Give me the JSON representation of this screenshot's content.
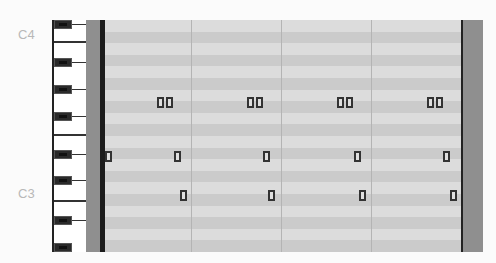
{
  "app": {
    "view": "piano-roll"
  },
  "octave_labels": [
    {
      "label": "C4",
      "y": 33
    },
    {
      "label": "C3",
      "y": 192
    }
  ],
  "colors": {
    "grid_light": "#dcdcdc",
    "grid_dark": "#cbcbcb",
    "side_strip": "#8f8f8f",
    "bar_line": "#1c1c1c",
    "note_border": "#333333"
  },
  "grid": {
    "beat_lines_x": [
      86,
      176,
      266
    ],
    "rows": 20
  },
  "notes": [
    {
      "x": 52,
      "y": 77,
      "group": 1
    },
    {
      "x": 61,
      "y": 77,
      "group": 1
    },
    {
      "x": 142,
      "y": 77,
      "group": 2
    },
    {
      "x": 151,
      "y": 77,
      "group": 2
    },
    {
      "x": 232,
      "y": 77,
      "group": 3
    },
    {
      "x": 241,
      "y": 77,
      "group": 3
    },
    {
      "x": 322,
      "y": 77,
      "group": 4
    },
    {
      "x": 331,
      "y": 77,
      "group": 4
    },
    {
      "x": 0,
      "y": 131,
      "group": 1
    },
    {
      "x": 69,
      "y": 131,
      "group": 1
    },
    {
      "x": 158,
      "y": 131,
      "group": 2
    },
    {
      "x": 249,
      "y": 131,
      "group": 3
    },
    {
      "x": 338,
      "y": 131,
      "group": 4
    },
    {
      "x": 75,
      "y": 170,
      "group": 1
    },
    {
      "x": 163,
      "y": 170,
      "group": 2
    },
    {
      "x": 254,
      "y": 170,
      "group": 3
    },
    {
      "x": 345,
      "y": 170,
      "group": 4
    }
  ]
}
